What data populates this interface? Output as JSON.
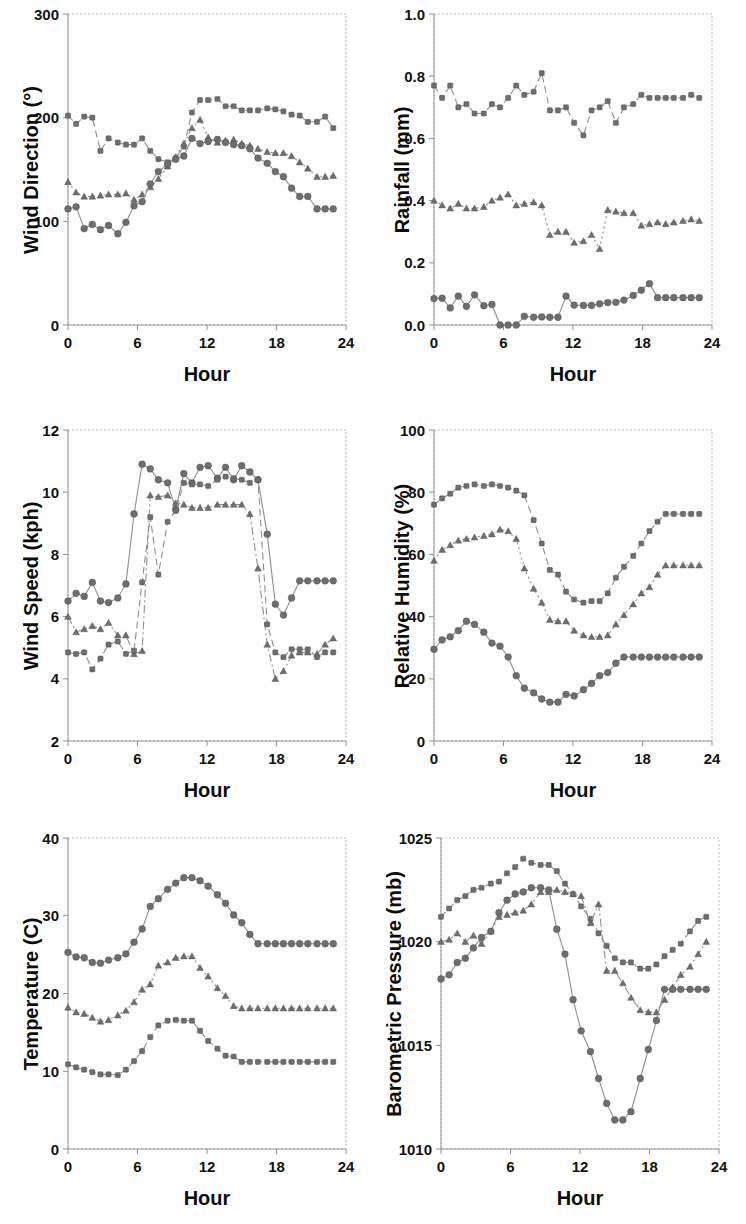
{
  "figure": {
    "background": "#ffffff",
    "marker_color": "#6e6e6e",
    "line_color": "#8e8e8e",
    "rows": 3,
    "cols": 2
  },
  "common": {
    "xlabel": "Hour",
    "xticks": [
      "0",
      "6",
      "12",
      "18",
      "24"
    ],
    "xlim": [
      0,
      24
    ]
  },
  "chart_data": [
    {
      "id": "wind-direction",
      "type": "line",
      "title": "",
      "xlabel": "Hour",
      "ylabel": "Wind Direction (°)",
      "xlim": [
        0,
        24
      ],
      "ylim": [
        0,
        300
      ],
      "xticks": [
        0,
        6,
        12,
        18,
        24
      ],
      "yticks": [
        0,
        100,
        200,
        300
      ],
      "ytick_labels": [
        "0",
        "100",
        "200",
        "300"
      ],
      "grid": false,
      "legend": "none",
      "x": [
        0,
        0.7,
        1.4,
        2.1,
        2.8,
        3.5,
        4.3,
        5.0,
        5.7,
        6.4,
        7.1,
        7.8,
        8.6,
        9.3,
        10.0,
        10.7,
        11.4,
        12.1,
        12.9,
        13.6,
        14.3,
        15.0,
        15.7,
        16.4,
        17.2,
        17.9,
        18.6,
        19.3,
        20.0,
        20.7,
        21.5,
        22.2,
        22.9
      ],
      "series": [
        {
          "name": "upper",
          "marker": "square",
          "linestyle": "dashed",
          "values": [
            202,
            194,
            201,
            200,
            168,
            180,
            176,
            174,
            174,
            180,
            168,
            160,
            157,
            161,
            172,
            205,
            217,
            217,
            218,
            211,
            211,
            207,
            207,
            207,
            209,
            208,
            206,
            203,
            202,
            196,
            196,
            201,
            190
          ]
        },
        {
          "name": "middle",
          "marker": "triangle",
          "linestyle": "dotted",
          "values": [
            138,
            128,
            124,
            124,
            125,
            126,
            126,
            127,
            121,
            126,
            133,
            141,
            153,
            162,
            175,
            190,
            198,
            181,
            176,
            178,
            179,
            175,
            173,
            170,
            167,
            166,
            166,
            163,
            157,
            151,
            143,
            143,
            144
          ]
        },
        {
          "name": "lower",
          "marker": "circle",
          "linestyle": "solid",
          "values": [
            112,
            114,
            93,
            97,
            92,
            96,
            88,
            99,
            115,
            119,
            136,
            148,
            155,
            160,
            163,
            180,
            175,
            177,
            179,
            176,
            174,
            173,
            170,
            161,
            156,
            148,
            143,
            132,
            124,
            124,
            112,
            112,
            112
          ]
        }
      ]
    },
    {
      "id": "rainfall",
      "type": "line",
      "title": "",
      "xlabel": "Hour",
      "ylabel": "Rainfall (mm)",
      "xlim": [
        0,
        24
      ],
      "ylim": [
        0.0,
        1.0
      ],
      "xticks": [
        0,
        6,
        12,
        18,
        24
      ],
      "yticks": [
        0.0,
        0.2,
        0.4,
        0.6,
        0.8,
        1.0
      ],
      "ytick_labels": [
        "0.0",
        "0.2",
        "0.4",
        "0.6",
        "0.8",
        "1.0"
      ],
      "grid": false,
      "legend": "none",
      "x": [
        0,
        0.7,
        1.4,
        2.1,
        2.8,
        3.5,
        4.3,
        5.0,
        5.7,
        6.4,
        7.1,
        7.8,
        8.6,
        9.3,
        10.0,
        10.7,
        11.4,
        12.1,
        12.9,
        13.6,
        14.3,
        15.0,
        15.7,
        16.4,
        17.2,
        17.9,
        18.6,
        19.3,
        20.0,
        20.7,
        21.5,
        22.2,
        22.9
      ],
      "series": [
        {
          "name": "upper",
          "marker": "square",
          "linestyle": "dashed",
          "values": [
            0.77,
            0.73,
            0.77,
            0.7,
            0.71,
            0.68,
            0.68,
            0.71,
            0.7,
            0.73,
            0.77,
            0.74,
            0.75,
            0.81,
            0.69,
            0.69,
            0.7,
            0.65,
            0.61,
            0.69,
            0.7,
            0.72,
            0.65,
            0.7,
            0.71,
            0.74,
            0.73,
            0.73,
            0.73,
            0.73,
            0.73,
            0.74,
            0.73
          ]
        },
        {
          "name": "middle",
          "marker": "triangle",
          "linestyle": "dotted",
          "values": [
            0.4,
            0.385,
            0.375,
            0.39,
            0.375,
            0.375,
            0.38,
            0.4,
            0.41,
            0.42,
            0.385,
            0.39,
            0.395,
            0.385,
            0.29,
            0.3,
            0.3,
            0.265,
            0.27,
            0.29,
            0.245,
            0.37,
            0.365,
            0.36,
            0.36,
            0.32,
            0.325,
            0.33,
            0.325,
            0.33,
            0.335,
            0.34,
            0.335
          ]
        },
        {
          "name": "lower",
          "marker": "circle",
          "linestyle": "solid",
          "values": [
            0.085,
            0.086,
            0.055,
            0.093,
            0.06,
            0.097,
            0.062,
            0.066,
            0.0,
            0.0,
            0.0,
            0.028,
            0.025,
            0.026,
            0.025,
            0.025,
            0.093,
            0.064,
            0.063,
            0.063,
            0.068,
            0.072,
            0.073,
            0.08,
            0.095,
            0.112,
            0.133,
            0.088,
            0.088,
            0.088,
            0.088,
            0.088,
            0.088
          ]
        }
      ]
    },
    {
      "id": "wind-speed",
      "type": "line",
      "title": "",
      "xlabel": "Hour",
      "ylabel": "Wind Speed (kph)",
      "xlim": [
        0,
        24
      ],
      "ylim": [
        2,
        12
      ],
      "xticks": [
        0,
        6,
        12,
        18,
        24
      ],
      "yticks": [
        2,
        4,
        6,
        8,
        10,
        12
      ],
      "ytick_labels": [
        "2",
        "4",
        "6",
        "8",
        "10",
        "12"
      ],
      "grid": false,
      "legend": "none",
      "x": [
        0,
        0.7,
        1.4,
        2.1,
        2.8,
        3.5,
        4.3,
        5.0,
        5.7,
        6.4,
        7.1,
        7.8,
        8.6,
        9.3,
        10.0,
        10.7,
        11.4,
        12.1,
        12.9,
        13.6,
        14.3,
        15.0,
        15.7,
        16.4,
        17.2,
        17.9,
        18.6,
        19.3,
        20.0,
        20.7,
        21.5,
        22.2,
        22.9
      ],
      "series": [
        {
          "name": "upper",
          "marker": "circle",
          "linestyle": "solid",
          "values": [
            6.5,
            6.75,
            6.65,
            7.1,
            6.5,
            6.45,
            6.6,
            7.05,
            9.3,
            10.9,
            10.75,
            10.4,
            10.3,
            9.45,
            10.6,
            10.3,
            10.8,
            10.85,
            10.45,
            10.8,
            10.4,
            10.85,
            10.65,
            10.4,
            8.65,
            6.4,
            6.05,
            6.6,
            7.15,
            7.15,
            7.15,
            7.15,
            7.15
          ]
        },
        {
          "name": "middle",
          "marker": "triangle",
          "linestyle": "dashdot",
          "values": [
            6.0,
            5.5,
            5.6,
            5.7,
            5.6,
            5.8,
            5.4,
            5.4,
            4.8,
            4.9,
            9.9,
            9.85,
            9.9,
            9.65,
            9.6,
            9.5,
            9.5,
            9.5,
            9.6,
            9.6,
            9.6,
            9.6,
            9.3,
            7.55,
            5.1,
            4.0,
            4.25,
            4.75,
            4.85,
            4.85,
            4.8,
            5.1,
            5.3
          ]
        },
        {
          "name": "lower",
          "marker": "square",
          "linestyle": "dashed",
          "values": [
            4.85,
            4.8,
            4.85,
            4.3,
            4.65,
            5.1,
            5.2,
            4.8,
            4.9,
            7.1,
            9.2,
            7.35,
            9.05,
            9.4,
            10.3,
            10.25,
            10.25,
            10.2,
            10.4,
            10.5,
            10.45,
            10.4,
            10.3,
            10.4,
            5.75,
            4.85,
            4.7,
            4.95,
            4.95,
            4.95,
            4.7,
            4.85,
            4.85
          ]
        }
      ]
    },
    {
      "id": "relative-humidity",
      "type": "line",
      "title": "",
      "xlabel": "Hour",
      "ylabel": "Relative Humidity (%)",
      "xlim": [
        0,
        24
      ],
      "ylim": [
        0,
        100
      ],
      "xticks": [
        0,
        6,
        12,
        18,
        24
      ],
      "yticks": [
        0,
        20,
        40,
        60,
        80,
        100
      ],
      "ytick_labels": [
        "0",
        "20",
        "40",
        "60",
        "80",
        "100"
      ],
      "grid": false,
      "legend": "none",
      "x": [
        0,
        0.7,
        1.4,
        2.1,
        2.8,
        3.5,
        4.3,
        5.0,
        5.7,
        6.4,
        7.1,
        7.8,
        8.6,
        9.3,
        10.0,
        10.7,
        11.4,
        12.1,
        12.9,
        13.6,
        14.3,
        15.0,
        15.7,
        16.4,
        17.2,
        17.9,
        18.6,
        19.3,
        20.0,
        20.7,
        21.5,
        22.2,
        22.9
      ],
      "series": [
        {
          "name": "upper",
          "marker": "square",
          "linestyle": "dashed",
          "values": [
            76,
            78,
            79.5,
            81.5,
            82,
            82.5,
            82,
            82.5,
            82,
            81.5,
            80.5,
            79,
            71,
            63.5,
            55,
            53.5,
            48,
            45.5,
            44.5,
            45,
            45,
            47.5,
            52.5,
            56,
            59.5,
            63.5,
            67.5,
            70.5,
            73,
            73,
            73,
            73,
            73
          ]
        },
        {
          "name": "middle",
          "marker": "triangle",
          "linestyle": "dotted",
          "values": [
            58,
            61.5,
            63,
            64.5,
            65,
            65.5,
            66,
            66.5,
            68,
            67.5,
            65,
            55.5,
            49,
            44.5,
            39,
            38.5,
            38.5,
            35.5,
            34,
            33.5,
            33.5,
            34,
            37.5,
            40.5,
            44,
            47.5,
            49.5,
            53.5,
            56.5,
            56.5,
            56.5,
            56.5,
            56.5
          ]
        },
        {
          "name": "lower",
          "marker": "circle",
          "linestyle": "solid",
          "values": [
            29.5,
            32.5,
            33.5,
            35.5,
            38.5,
            37.5,
            35,
            31.5,
            30.5,
            27,
            21,
            17,
            15.5,
            13.5,
            12.5,
            12.5,
            15,
            14.5,
            16.5,
            18.5,
            21,
            22,
            25,
            27,
            27,
            27,
            27,
            27,
            27,
            27,
            27,
            27,
            27
          ]
        }
      ]
    },
    {
      "id": "temperature",
      "type": "line",
      "title": "",
      "xlabel": "Hour",
      "ylabel": "Temperature (C)",
      "xlim": [
        0,
        24
      ],
      "ylim": [
        0,
        40
      ],
      "xticks": [
        0,
        6,
        12,
        18,
        24
      ],
      "yticks": [
        0,
        10,
        20,
        30,
        40
      ],
      "ytick_labels": [
        "0",
        "10",
        "20",
        "30",
        "40"
      ],
      "grid": false,
      "legend": "none",
      "x": [
        0,
        0.7,
        1.4,
        2.1,
        2.8,
        3.5,
        4.3,
        5.0,
        5.7,
        6.4,
        7.1,
        7.8,
        8.6,
        9.3,
        10.0,
        10.7,
        11.4,
        12.1,
        12.9,
        13.6,
        14.3,
        15.0,
        15.7,
        16.4,
        17.2,
        17.9,
        18.6,
        19.3,
        20.0,
        20.7,
        21.5,
        22.2,
        22.9
      ],
      "series": [
        {
          "name": "upper",
          "marker": "circle",
          "linestyle": "solid",
          "values": [
            25.3,
            24.7,
            24.6,
            24.0,
            23.9,
            24.3,
            24.6,
            25.1,
            26.6,
            28.3,
            31.2,
            32.2,
            33.4,
            34.2,
            34.9,
            34.9,
            34.5,
            33.8,
            32.7,
            31.6,
            30.1,
            29.1,
            27.6,
            26.4,
            26.4,
            26.4,
            26.4,
            26.4,
            26.4,
            26.4,
            26.4,
            26.4,
            26.4
          ]
        },
        {
          "name": "middle",
          "marker": "triangle",
          "linestyle": "dotted",
          "values": [
            18.2,
            17.6,
            17.4,
            16.9,
            16.4,
            16.6,
            17.2,
            17.8,
            18.9,
            20.5,
            21.2,
            23.6,
            24.0,
            24.6,
            24.8,
            24.8,
            23.3,
            22.2,
            20.7,
            19.7,
            18.4,
            18.1,
            18.1,
            18.1,
            18.1,
            18.1,
            18.1,
            18.1,
            18.1,
            18.1,
            18.1,
            18.1,
            18.1
          ]
        },
        {
          "name": "lower",
          "marker": "square",
          "linestyle": "dashed",
          "values": [
            10.9,
            10.5,
            10.2,
            9.9,
            9.6,
            9.6,
            9.5,
            10.2,
            11.3,
            12.6,
            14.4,
            15.9,
            16.5,
            16.6,
            16.5,
            16.5,
            15.2,
            13.9,
            12.9,
            12.0,
            11.9,
            11.2,
            11.2,
            11.2,
            11.2,
            11.2,
            11.2,
            11.2,
            11.2,
            11.2,
            11.2,
            11.2,
            11.2
          ]
        }
      ]
    },
    {
      "id": "barometric-pressure",
      "type": "line",
      "title": "",
      "xlabel": "Hour",
      "ylabel": "Barometric Pressure (mb)",
      "xlim": [
        0,
        24
      ],
      "ylim": [
        1010,
        1025
      ],
      "xticks": [
        0,
        6,
        12,
        18,
        24
      ],
      "yticks": [
        1010,
        1015,
        1020,
        1025
      ],
      "ytick_labels": [
        "1010",
        "1015",
        "1020",
        "1025"
      ],
      "grid": false,
      "legend": "none",
      "x": [
        0,
        0.7,
        1.4,
        2.1,
        2.8,
        3.5,
        4.3,
        5.0,
        5.7,
        6.4,
        7.1,
        7.8,
        8.6,
        9.3,
        10.0,
        10.7,
        11.4,
        12.1,
        12.9,
        13.6,
        14.3,
        15.0,
        15.7,
        16.4,
        17.2,
        17.9,
        18.6,
        19.3,
        20.0,
        20.7,
        21.5,
        22.2,
        22.9
      ],
      "series": [
        {
          "name": "upper",
          "marker": "square",
          "linestyle": "dashed",
          "values": [
            1021.2,
            1021.6,
            1022.0,
            1022.2,
            1022.5,
            1022.6,
            1022.8,
            1022.9,
            1023.3,
            1023.6,
            1024.0,
            1023.8,
            1023.7,
            1023.7,
            1023.4,
            1022.8,
            1022.3,
            1021.7,
            1021.1,
            1020.4,
            1019.8,
            1019.2,
            1019.0,
            1019.0,
            1018.7,
            1018.7,
            1018.9,
            1019.3,
            1019.6,
            1019.9,
            1020.5,
            1021.0,
            1021.2
          ]
        },
        {
          "name": "middle",
          "marker": "triangle",
          "linestyle": "dashdot",
          "values": [
            1020.0,
            1020.1,
            1020.4,
            1020.0,
            1020.3,
            1019.9,
            1020.5,
            1021.2,
            1021.3,
            1021.4,
            1021.5,
            1021.8,
            1022.4,
            1022.4,
            1022.5,
            1022.4,
            1022.3,
            1022.2,
            1020.9,
            1021.8,
            1018.6,
            1018.6,
            1018.0,
            1017.3,
            1016.7,
            1016.6,
            1016.6,
            1017.2,
            1017.8,
            1018.4,
            1018.8,
            1019.4,
            1020.0
          ]
        },
        {
          "name": "lower",
          "marker": "circle",
          "linestyle": "solid",
          "values": [
            1018.2,
            1018.4,
            1019.0,
            1019.2,
            1019.7,
            1020.2,
            1020.5,
            1021.4,
            1022.0,
            1022.3,
            1022.4,
            1022.6,
            1022.6,
            1022.5,
            1020.6,
            1019.4,
            1017.2,
            1015.7,
            1014.7,
            1013.4,
            1012.2,
            1011.4,
            1011.4,
            1011.8,
            1013.4,
            1014.8,
            1016.2,
            1017.7,
            1017.7,
            1017.7,
            1017.7,
            1017.7,
            1017.7
          ]
        }
      ]
    }
  ]
}
